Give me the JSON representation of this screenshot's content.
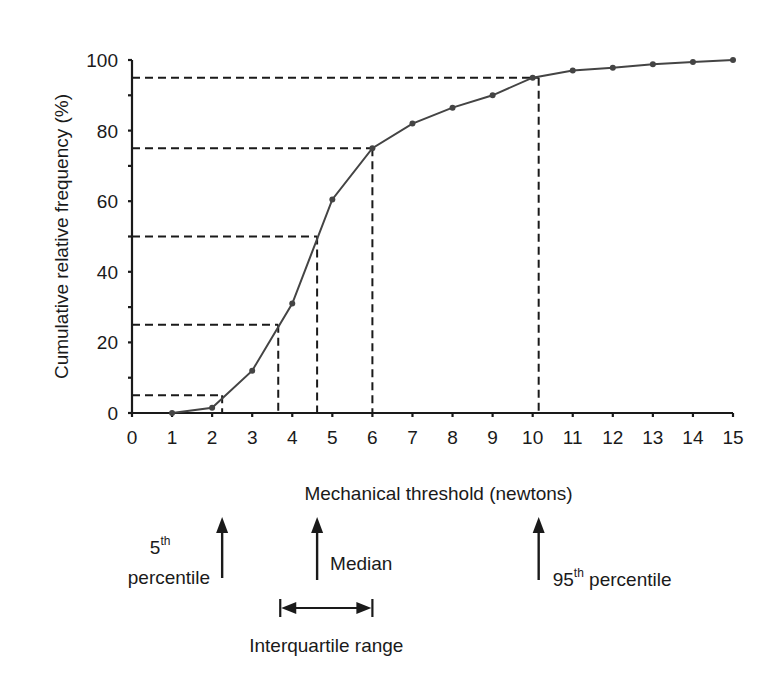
{
  "chart_data": {
    "type": "line",
    "title": "",
    "xlabel": "Mechanical threshold (newtons)",
    "ylabel": "Cumulative relative frequency (%)",
    "xlim": [
      0,
      15
    ],
    "ylim": [
      0,
      100
    ],
    "x_ticks": [
      "0",
      "1",
      "2",
      "3",
      "4",
      "5",
      "6",
      "7",
      "8",
      "9",
      "10",
      "11",
      "12",
      "13",
      "14",
      "15"
    ],
    "y_ticks": [
      "0",
      "20",
      "40",
      "60",
      "80",
      "100"
    ],
    "y_minor_step": 10,
    "grid": false,
    "series": [
      {
        "name": "Cumulative relative frequency",
        "x": [
          1,
          2,
          3,
          4,
          5,
          6,
          7,
          8,
          9,
          10,
          11,
          12,
          13,
          14,
          15
        ],
        "values": [
          0,
          1.5,
          12,
          31,
          60.5,
          75,
          82,
          86.5,
          90,
          95,
          97,
          97.8,
          98.8,
          99.4,
          100
        ],
        "color": "#444444"
      }
    ],
    "reference_lines": [
      {
        "name": "5th percentile",
        "y": 5,
        "x": 2.25
      },
      {
        "name": "25th percentile",
        "y": 25,
        "x": 3.65
      },
      {
        "name": "median",
        "y": 50,
        "x": 4.62
      },
      {
        "name": "75th percentile",
        "y": 75,
        "x": 6.0
      },
      {
        "name": "95th percentile",
        "y": 95,
        "x": 10.15
      }
    ],
    "annotations": {
      "p5": {
        "base": "5",
        "sup": "th",
        "line2": "percentile",
        "x": 2.25
      },
      "median": {
        "text": "Median",
        "x": 4.62
      },
      "p95": {
        "base": "95",
        "sup": "th",
        "rest": " percentile",
        "x": 10.15
      },
      "iqr": {
        "text": "Interquartile range",
        "x_from": 3.65,
        "x_to": 6.0
      }
    }
  }
}
